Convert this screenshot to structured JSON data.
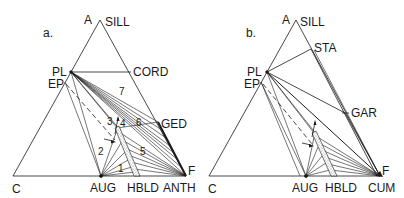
{
  "colors": {
    "ink": "#1a1a1a",
    "bg": "#ffffff",
    "stipple": "#888888"
  },
  "panels": [
    {
      "id": "a",
      "panel_label": "a.",
      "panel_label_pos": [
        43,
        37
      ],
      "vertices": {
        "A": [
          100,
          20
        ],
        "C": [
          13,
          176
        ],
        "F": [
          186,
          176
        ]
      },
      "vertex_labels": [
        {
          "text": "A",
          "x": 84,
          "y": 24
        },
        {
          "text": "SILL",
          "x": 105,
          "y": 26
        },
        {
          "text": "C",
          "x": 12,
          "y": 193
        },
        {
          "text": "F",
          "x": 188,
          "y": 175
        }
      ],
      "points": {
        "PL": [
          71,
          72
        ],
        "EP": [
          65,
          82
        ],
        "CORD": [
          131,
          72
        ],
        "GED": [
          158,
          122
        ],
        "AUG": [
          101,
          176
        ],
        "HBLD_top": [
          117,
          128
        ],
        "HBLD_bot": [
          137,
          176
        ],
        "ANTH": [
          186,
          176
        ]
      },
      "point_labels": [
        {
          "text": "PL",
          "x": 52,
          "y": 76
        },
        {
          "text": "EP",
          "x": 48,
          "y": 88
        },
        {
          "text": "CORD",
          "x": 133,
          "y": 76
        },
        {
          "text": "GED",
          "x": 161,
          "y": 128
        },
        {
          "text": "AUG",
          "x": 90,
          "y": 192
        },
        {
          "text": "HBLD",
          "x": 127,
          "y": 192
        },
        {
          "text": "ANTH",
          "x": 163,
          "y": 192
        }
      ],
      "field_numbers": [
        {
          "text": "7",
          "x": 119,
          "y": 95
        },
        {
          "text": "6",
          "x": 136,
          "y": 126
        },
        {
          "text": "3",
          "x": 107,
          "y": 125
        },
        {
          "text": "4",
          "x": 120,
          "y": 127
        },
        {
          "text": "2",
          "x": 98,
          "y": 155
        },
        {
          "text": "5",
          "x": 140,
          "y": 155
        },
        {
          "text": "1",
          "x": 118,
          "y": 172
        }
      ]
    },
    {
      "id": "b",
      "panel_label": "b.",
      "panel_label_pos": [
        246,
        37
      ],
      "vertices": {
        "A": [
          296,
          20
        ],
        "C": [
          209,
          176
        ],
        "F": [
          380,
          176
        ]
      },
      "vertex_labels": [
        {
          "text": "A",
          "x": 282,
          "y": 24
        },
        {
          "text": "SILL",
          "x": 300,
          "y": 26
        },
        {
          "text": "C",
          "x": 208,
          "y": 193
        },
        {
          "text": "F",
          "x": 382,
          "y": 175
        }
      ],
      "points": {
        "PL": [
          267,
          72
        ],
        "EP": [
          261,
          82
        ],
        "STA": [
          311,
          49
        ],
        "GAR": [
          345,
          113
        ],
        "AUG": [
          306,
          176
        ],
        "HBLD_top": [
          314,
          133
        ],
        "HBLD_bot": [
          334,
          176
        ],
        "CUM": [
          380,
          176
        ]
      },
      "point_labels": [
        {
          "text": "PL",
          "x": 247,
          "y": 76
        },
        {
          "text": "EP",
          "x": 244,
          "y": 88
        },
        {
          "text": "STA",
          "x": 314,
          "y": 52
        },
        {
          "text": "GAR",
          "x": 351,
          "y": 117
        },
        {
          "text": "AUG",
          "x": 292,
          "y": 192
        },
        {
          "text": "HBLD",
          "x": 325,
          "y": 192
        },
        {
          "text": "CUM",
          "x": 368,
          "y": 192
        }
      ],
      "field_numbers": []
    }
  ]
}
